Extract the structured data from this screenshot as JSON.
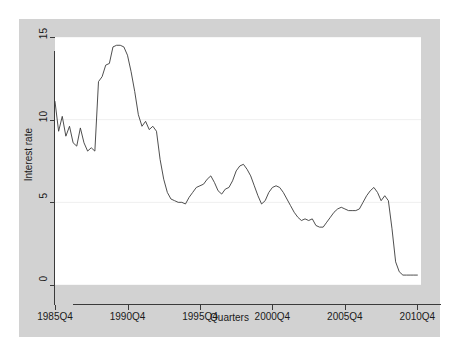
{
  "chart_data": {
    "type": "line",
    "title": "",
    "xlabel": "Quarters",
    "ylabel": "Interest rate",
    "xlim": [
      1985.75,
      2011.0
    ],
    "ylim": [
      0,
      15
    ],
    "yticks": [
      0,
      5,
      10,
      15
    ],
    "ytick_labels": [
      "0",
      "5",
      "10",
      "15"
    ],
    "xticks": [
      1985.75,
      1990.75,
      1995.75,
      2000.75,
      2005.75,
      2010.75
    ],
    "xtick_labels": [
      "1985Q4",
      "1990Q4",
      "1995Q4",
      "2000Q4",
      "2005Q4",
      "2010Q4"
    ],
    "grid": "horizontal",
    "legend": "none",
    "series": [
      {
        "name": "Interest rate",
        "x": [
          1985.75,
          1986.0,
          1986.25,
          1986.5,
          1986.75,
          1987.0,
          1987.25,
          1987.5,
          1987.75,
          1988.0,
          1988.25,
          1988.5,
          1988.75,
          1989.0,
          1989.25,
          1989.5,
          1989.75,
          1990.0,
          1990.25,
          1990.5,
          1990.75,
          1991.0,
          1991.25,
          1991.5,
          1991.75,
          1992.0,
          1992.25,
          1992.5,
          1992.75,
          1993.0,
          1993.25,
          1993.5,
          1993.75,
          1994.0,
          1994.25,
          1994.5,
          1994.75,
          1995.0,
          1995.25,
          1995.5,
          1995.75,
          1996.0,
          1996.25,
          1996.5,
          1996.75,
          1997.0,
          1997.25,
          1997.5,
          1997.75,
          1998.0,
          1998.25,
          1998.5,
          1998.75,
          1999.0,
          1999.25,
          1999.5,
          1999.75,
          2000.0,
          2000.25,
          2000.5,
          2000.75,
          2001.0,
          2001.25,
          2001.5,
          2001.75,
          2002.0,
          2002.25,
          2002.5,
          2002.75,
          2003.0,
          2003.25,
          2003.5,
          2003.75,
          2004.0,
          2004.25,
          2004.5,
          2004.75,
          2005.0,
          2005.25,
          2005.5,
          2005.75,
          2006.0,
          2006.25,
          2006.5,
          2006.75,
          2007.0,
          2007.25,
          2007.5,
          2007.75,
          2008.0,
          2008.25,
          2008.5,
          2008.75,
          2009.0,
          2009.25,
          2009.5,
          2009.75,
          2010.0,
          2010.25,
          2010.5,
          2010.75
        ],
        "y": [
          11.1,
          9.3,
          10.2,
          9.0,
          9.6,
          8.6,
          8.4,
          9.5,
          8.6,
          8.1,
          8.3,
          8.1,
          12.3,
          12.6,
          13.3,
          13.4,
          14.4,
          14.5,
          14.5,
          14.4,
          13.9,
          12.9,
          11.7,
          10.3,
          9.6,
          9.9,
          9.4,
          9.6,
          9.3,
          7.6,
          6.4,
          5.6,
          5.2,
          5.1,
          5.0,
          5.0,
          4.9,
          5.3,
          5.6,
          5.9,
          6.0,
          6.1,
          6.4,
          6.6,
          6.2,
          5.7,
          5.5,
          5.8,
          5.9,
          6.3,
          6.9,
          7.2,
          7.3,
          7.0,
          6.6,
          6.0,
          5.4,
          4.9,
          5.1,
          5.6,
          5.9,
          6.0,
          5.9,
          5.6,
          5.2,
          4.8,
          4.4,
          4.1,
          3.9,
          4.0,
          3.9,
          4.0,
          3.6,
          3.5,
          3.5,
          3.8,
          4.1,
          4.4,
          4.6,
          4.7,
          4.6,
          4.5,
          4.5,
          4.5,
          4.6,
          5.0,
          5.4,
          5.7,
          5.9,
          5.6,
          5.1,
          5.4,
          5.1,
          3.4,
          1.4,
          0.8,
          0.6,
          0.6,
          0.6,
          0.6,
          0.6
        ]
      }
    ]
  },
  "axes": {
    "x_title": "Quarters",
    "y_title": "Interest rate"
  }
}
